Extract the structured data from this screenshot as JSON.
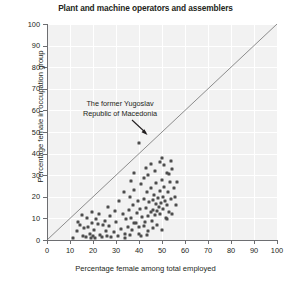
{
  "chart_data": {
    "type": "scatter",
    "title": "Plant and machine operators and assemblers",
    "xlabel": "Percentage female among total employed",
    "ylabel": "Percentage female in occupation group",
    "xlim": [
      0,
      100
    ],
    "ylim": [
      0,
      100
    ],
    "xticks": [
      0,
      10,
      20,
      30,
      40,
      50,
      60,
      70,
      80,
      90,
      100
    ],
    "yticks": [
      0,
      10,
      20,
      30,
      40,
      50,
      60,
      70,
      80,
      90,
      100
    ],
    "grid": true,
    "legend": null,
    "reference_line": {
      "type": "identity",
      "from": [
        0,
        0
      ],
      "to": [
        100,
        100
      ]
    },
    "annotations": [
      {
        "text": "The former Yugoslav Republic of Macedonia",
        "line1": "The former Yugoslav",
        "line2": "Republic of Macedonia",
        "points_to": [
          40,
          45
        ]
      }
    ],
    "marker_color": "#4d4d4d",
    "plot_background": "#f2f2f2",
    "points": [
      [
        40.0,
        45.0
      ],
      [
        11.5,
        1.0
      ],
      [
        13.0,
        4.0
      ],
      [
        14.5,
        7.0
      ],
      [
        15.5,
        2.0
      ],
      [
        16.0,
        5.5
      ],
      [
        17.0,
        1.5
      ],
      [
        18.0,
        6.0
      ],
      [
        18.5,
        3.0
      ],
      [
        19.0,
        0.8
      ],
      [
        19.5,
        8.0
      ],
      [
        20.0,
        2.0
      ],
      [
        20.5,
        4.5
      ],
      [
        21.0,
        1.0
      ],
      [
        22.0,
        7.5
      ],
      [
        23.0,
        2.5
      ],
      [
        24.0,
        1.2
      ],
      [
        25.0,
        9.0
      ],
      [
        25.5,
        4.0
      ],
      [
        26.0,
        2.0
      ],
      [
        27.0,
        6.5
      ],
      [
        28.0,
        1.5
      ],
      [
        29.0,
        3.5
      ],
      [
        30.0,
        8.5
      ],
      [
        31.0,
        2.0
      ],
      [
        32.0,
        5.0
      ],
      [
        33.0,
        12.0
      ],
      [
        34.0,
        3.0
      ],
      [
        34.5,
        9.5
      ],
      [
        35.0,
        6.0
      ],
      [
        35.5,
        14.0
      ],
      [
        36.0,
        20.0
      ],
      [
        36.5,
        10.0
      ],
      [
        37.0,
        4.5
      ],
      [
        37.5,
        16.0
      ],
      [
        38.0,
        23.0
      ],
      [
        38.5,
        8.0
      ],
      [
        39.0,
        12.5
      ],
      [
        39.5,
        18.0
      ],
      [
        40.0,
        6.0
      ],
      [
        40.5,
        14.5
      ],
      [
        41.0,
        26.0
      ],
      [
        41.5,
        10.5
      ],
      [
        42.0,
        19.0
      ],
      [
        42.5,
        8.5
      ],
      [
        43.0,
        15.0
      ],
      [
        43.5,
        22.0
      ],
      [
        44.0,
        11.0
      ],
      [
        44.5,
        17.5
      ],
      [
        45.0,
        13.0
      ],
      [
        45.3,
        24.0
      ],
      [
        45.6,
        9.0
      ],
      [
        46.0,
        18.5
      ],
      [
        46.3,
        14.0
      ],
      [
        46.6,
        21.0
      ],
      [
        47.0,
        11.5
      ],
      [
        47.3,
        16.5
      ],
      [
        47.6,
        26.5
      ],
      [
        48.0,
        13.5
      ],
      [
        48.3,
        19.5
      ],
      [
        48.6,
        15.5
      ],
      [
        49.0,
        22.5
      ],
      [
        49.3,
        12.0
      ],
      [
        49.6,
        17.0
      ],
      [
        50.0,
        28.0
      ],
      [
        50.3,
        20.0
      ],
      [
        50.6,
        14.5
      ],
      [
        51.0,
        24.5
      ],
      [
        51.3,
        18.0
      ],
      [
        51.6,
        10.0
      ],
      [
        52.0,
        31.0
      ],
      [
        52.3,
        16.0
      ],
      [
        52.6,
        22.0
      ],
      [
        53.0,
        13.0
      ],
      [
        53.5,
        27.0
      ],
      [
        54.0,
        19.0
      ],
      [
        54.5,
        33.0
      ],
      [
        55.0,
        24.0
      ],
      [
        44.0,
        30.0
      ],
      [
        45.0,
        35.0
      ],
      [
        47.0,
        32.0
      ],
      [
        49.0,
        36.0
      ],
      [
        51.0,
        34.5
      ],
      [
        53.0,
        30.5
      ],
      [
        42.0,
        28.5
      ],
      [
        38.0,
        31.0
      ],
      [
        36.5,
        27.5
      ],
      [
        43.0,
        33.5
      ],
      [
        50.0,
        38.0
      ],
      [
        54.0,
        36.5
      ],
      [
        33.5,
        22.0
      ],
      [
        31.5,
        18.0
      ],
      [
        29.5,
        13.5
      ],
      [
        27.5,
        11.0
      ],
      [
        26.5,
        15.5
      ],
      [
        24.5,
        7.0
      ],
      [
        22.5,
        12.0
      ],
      [
        21.5,
        9.5
      ],
      [
        19.5,
        13.0
      ],
      [
        17.5,
        10.0
      ],
      [
        15.0,
        11.5
      ],
      [
        13.5,
        8.5
      ],
      [
        46.0,
        5.5
      ],
      [
        48.0,
        7.0
      ],
      [
        44.0,
        4.0
      ],
      [
        42.0,
        6.5
      ],
      [
        40.0,
        3.0
      ],
      [
        38.0,
        8.0
      ],
      [
        50.0,
        4.5
      ],
      [
        52.0,
        9.5
      ],
      [
        54.5,
        12.0
      ],
      [
        56.0,
        16.0
      ],
      [
        55.5,
        20.0
      ],
      [
        56.5,
        27.0
      ],
      [
        43.5,
        2.5
      ],
      [
        41.0,
        1.8
      ],
      [
        36.0,
        2.2
      ],
      [
        34.0,
        1.0
      ]
    ]
  }
}
